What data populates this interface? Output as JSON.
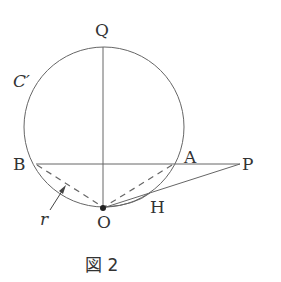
{
  "figure": {
    "caption": "図 2",
    "labels": {
      "Q": "Q",
      "C": "C′",
      "B": "B",
      "A": "A",
      "P": "P",
      "O": "O",
      "H": "H",
      "r": "r"
    },
    "colors": {
      "line": "#555555",
      "text": "#333333"
    }
  }
}
